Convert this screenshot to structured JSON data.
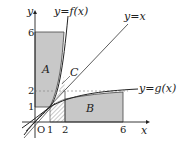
{
  "diagram": {
    "axes": {
      "x_label": "x",
      "y_label": "y",
      "origin_label": "O"
    },
    "x_ticks": [
      "1",
      "2",
      "6"
    ],
    "y_ticks": [
      "1",
      "2",
      "6"
    ],
    "curves": {
      "f": "y=f(x)",
      "g": "y=g(x)",
      "identity": "y=x"
    },
    "regions": {
      "A": "A",
      "B": "B",
      "C": "C"
    },
    "colors": {
      "shade": "#c8c8c8",
      "line": "#222222",
      "dashed": "#888888"
    }
  }
}
